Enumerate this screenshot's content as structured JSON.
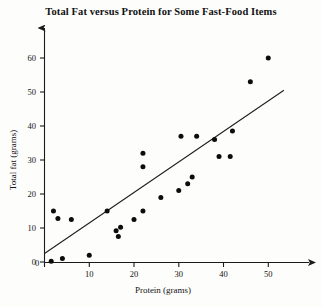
{
  "chart_data": {
    "type": "scatter",
    "title": "Total Fat versus Protein for Some Fast-Food Items",
    "xlabel": "Protein (grams)",
    "ylabel": "Total fat (grams)",
    "xlim": [
      0,
      58
    ],
    "ylim": [
      0,
      64
    ],
    "xticks": [
      0,
      10,
      20,
      30,
      40,
      50
    ],
    "xtick_labels": [
      "0",
      "10",
      "20",
      "30",
      "40",
      "50"
    ],
    "yticks": [
      0,
      10,
      20,
      30,
      40,
      50,
      60
    ],
    "ytick_labels": [
      "0",
      "10",
      "20",
      "30",
      "40",
      "50",
      "60"
    ],
    "grid": false,
    "legend": "none",
    "axis_style": "arrow-ended",
    "points": [
      {
        "x": 1.5,
        "y": 0.2
      },
      {
        "x": 2.0,
        "y": 15.0
      },
      {
        "x": 3.0,
        "y": 12.8
      },
      {
        "x": 4.0,
        "y": 1.0
      },
      {
        "x": 6.0,
        "y": 12.5
      },
      {
        "x": 10.0,
        "y": 2.0
      },
      {
        "x": 14.0,
        "y": 15.0
      },
      {
        "x": 16.0,
        "y": 9.2
      },
      {
        "x": 16.5,
        "y": 7.5
      },
      {
        "x": 17.0,
        "y": 10.2
      },
      {
        "x": 20.0,
        "y": 12.5
      },
      {
        "x": 22.0,
        "y": 32.0
      },
      {
        "x": 22.0,
        "y": 28.0
      },
      {
        "x": 22.0,
        "y": 15.0
      },
      {
        "x": 26.0,
        "y": 19.0
      },
      {
        "x": 30.0,
        "y": 21.0
      },
      {
        "x": 30.5,
        "y": 37.0
      },
      {
        "x": 32.0,
        "y": 23.0
      },
      {
        "x": 33.0,
        "y": 25.0
      },
      {
        "x": 34.0,
        "y": 37.0
      },
      {
        "x": 38.0,
        "y": 36.0
      },
      {
        "x": 39.0,
        "y": 31.0
      },
      {
        "x": 41.5,
        "y": 31.0
      },
      {
        "x": 42.0,
        "y": 38.5
      },
      {
        "x": 46.0,
        "y": 53.0
      },
      {
        "x": 50.0,
        "y": 60.0
      }
    ],
    "fit_line": {
      "label": "least-squares line",
      "x_start": 0.0,
      "y_start": 2.5,
      "x_end": 53.5,
      "y_end": 50.5
    }
  }
}
